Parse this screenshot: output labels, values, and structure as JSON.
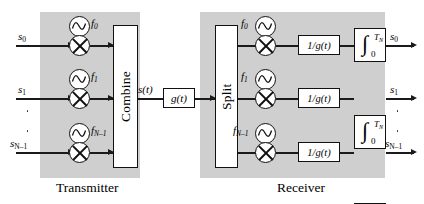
{
  "diagram": {
    "title_transmitter": "Transmitter",
    "title_receiver": "Receiver",
    "signal_label": "s(t)",
    "pulse_shape_label": "g(t)",
    "combine_label": "Combine",
    "split_label": "Split",
    "inverse_filter_label": "1/g(t)",
    "integral_symbol": "∫",
    "integral_upper": "T",
    "integral_upper_sub": "N",
    "integral_lower": "0",
    "colors": {
      "shade": "#cfcfcf",
      "line": "#1a1a1a",
      "box_fill": "#ffffff"
    },
    "tx_inputs": [
      {
        "name": "s",
        "sub": "0"
      },
      {
        "name": "s",
        "sub": "1"
      },
      {
        "name": "s",
        "sub": "N–1"
      }
    ],
    "rx_outputs": [
      {
        "name": "s",
        "sub": "0"
      },
      {
        "name": "s",
        "sub": "1"
      },
      {
        "name": "s",
        "sub": "N–1"
      }
    ],
    "carriers": [
      {
        "name": "f",
        "sub": "0"
      },
      {
        "name": "f",
        "sub": "1"
      },
      {
        "name": "f",
        "sub": "N–1"
      }
    ],
    "icons": {
      "oscillator": "sine-wave-oscillator-icon",
      "mixer": "multiplier-mixer-icon",
      "arrow": "arrowhead-icon",
      "vertical-dots": "vertical-ellipsis-icon"
    }
  }
}
